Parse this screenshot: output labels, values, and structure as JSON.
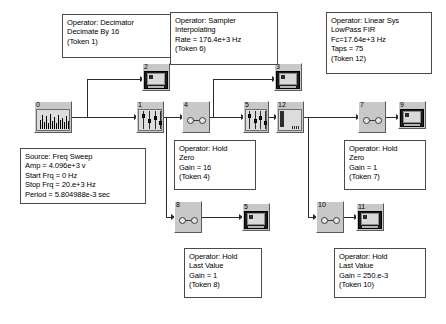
{
  "diagram": {
    "background": "#ffffff",
    "wire_color": "#2b2b2b",
    "node_fill": "#c8c8c8",
    "note_border": "#4a4a4a"
  },
  "notes": {
    "decimator": "Operator: Decimator\nDecimate By 16\n(Token 1)",
    "sampler": "Operator: Sampler\nInterpolating\nRate = 176.4e+3 Hz\n(Token 6)",
    "linear_sys": "Operator: Linear Sys\nLowPass FIR\nFc=17.64e+3 Hz\nTaps = 75\n(Token 12)",
    "source": "Source: Freq Sweep\nAmp = 4.096e+3 v\nStart Frq = 0 Hz\nStop Frq = 20.e+3 Hz\nPeriod = 5.804988e-3 sec",
    "hold_zero_16": "Operator: Hold\nZero\nGain = 16\n(Token 4)",
    "hold_zero_1": "Operator: Hold\nZero\nGain = 1\n(Token 7)",
    "hold_last_1": "Operator: Hold\nLast Value\nGain = 1\n(Token 8)",
    "hold_last_250m": "Operator: Hold\nLast Value\nGain = 250.e-3\n(Token 10)"
  },
  "nodes": [
    {
      "id": "0",
      "kind": "source",
      "name": "source-freq-sweep"
    },
    {
      "id": "1",
      "kind": "slider",
      "name": "decimator"
    },
    {
      "id": "2",
      "kind": "monitor",
      "name": "display-2"
    },
    {
      "id": "3",
      "kind": "monitor",
      "name": "display-3"
    },
    {
      "id": "4",
      "kind": "circles",
      "name": "hold-zero-gain-16"
    },
    {
      "id": "5",
      "kind": "monitor",
      "name": "display-5"
    },
    {
      "id": "6",
      "kind": "slider",
      "name": "sampler-interpolating"
    },
    {
      "id": "7",
      "kind": "circles",
      "name": "hold-zero-gain-1"
    },
    {
      "id": "8",
      "kind": "circles",
      "name": "hold-last-value-gain-1"
    },
    {
      "id": "9",
      "kind": "monitor",
      "name": "display-9"
    },
    {
      "id": "10",
      "kind": "circles",
      "name": "hold-last-value-gain-250m"
    },
    {
      "id": "11",
      "kind": "monitor",
      "name": "display-11"
    },
    {
      "id": "12",
      "kind": "filter",
      "name": "linear-sys-lowpass-fir"
    }
  ]
}
